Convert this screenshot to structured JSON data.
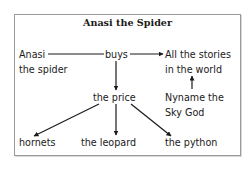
{
  "title": "Anasi the Spider",
  "nodes": {
    "anasi": {
      "line1": "Anasi",
      "line2": "the spider"
    },
    "buys": {
      "label": "buys"
    },
    "stories": {
      "line1": "All the stories",
      "line2": "in the world"
    },
    "price": {
      "label": "the price"
    },
    "nyname": {
      "line1": "Nyname the",
      "line2": "Sky God"
    },
    "hornets": {
      "label": "hornets"
    },
    "leopard": {
      "label": "the leopard"
    },
    "python": {
      "label": "the python"
    }
  },
  "edges": [
    {
      "from": "Anasi the spider",
      "to": "buys",
      "arrow": false
    },
    {
      "from": "buys",
      "to": "All the stories in the world",
      "arrow": true
    },
    {
      "from": "buys",
      "to": "the price",
      "arrow": true
    },
    {
      "from": "Nyname the Sky God",
      "to": "All the stories in the world",
      "arrow": true
    },
    {
      "from": "the price",
      "to": "hornets",
      "arrow": true
    },
    {
      "from": "the price",
      "to": "the leopard",
      "arrow": true
    },
    {
      "from": "the price",
      "to": "the python",
      "arrow": true
    }
  ]
}
